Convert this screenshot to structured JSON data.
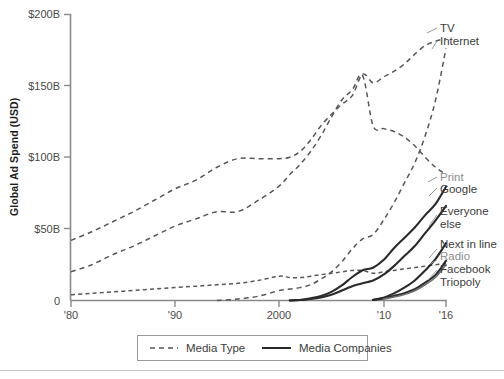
{
  "chart_data": {
    "type": "line",
    "title": "",
    "subtitle": "",
    "xlabel": "",
    "ylabel": "Global Ad Spend (USD)",
    "xlim": [
      1980,
      2016
    ],
    "ylim": [
      0,
      200
    ],
    "grid": false,
    "y_unit": "billions USD",
    "y_ticks": [
      0,
      50,
      100,
      150,
      200
    ],
    "y_tick_labels": [
      "0",
      "$50B",
      "$100B",
      "$150B",
      "$200B"
    ],
    "x_ticks": [
      1980,
      1990,
      2000,
      2010,
      2016
    ],
    "x_tick_labels": [
      "'80",
      "'90",
      "2000",
      "'10",
      "'16"
    ],
    "legend": {
      "position": "bottom-center",
      "entries": [
        {
          "label": "Media Type",
          "style": "dashed"
        },
        {
          "label": "Media Companies",
          "style": "solid"
        }
      ]
    },
    "series": [
      {
        "name": "TV",
        "style": "dashed",
        "group": "Media Type",
        "label_text": "TV",
        "x": [
          1980,
          1982,
          1984,
          1986,
          1988,
          1990,
          1992,
          1994,
          1996,
          1998,
          2000,
          2001,
          2002,
          2003,
          2004,
          2005,
          2006,
          2007,
          2008,
          2009,
          2010,
          2011,
          2012,
          2013,
          2014,
          2015,
          2016
        ],
        "values": [
          42,
          48,
          55,
          62,
          70,
          78,
          84,
          93,
          99,
          99,
          99,
          100,
          104,
          112,
          122,
          130,
          137,
          143,
          158,
          152,
          156,
          160,
          165,
          172,
          178,
          181,
          183
        ]
      },
      {
        "name": "Internet",
        "style": "dashed",
        "group": "Media Type",
        "label_text": "Internet",
        "x": [
          1994,
          1996,
          1998,
          2000,
          2001,
          2002,
          2003,
          2004,
          2005,
          2006,
          2007,
          2008,
          2009,
          2010,
          2011,
          2012,
          2013,
          2014,
          2015,
          2016
        ],
        "values": [
          0,
          1,
          3,
          7,
          8,
          9,
          11,
          15,
          20,
          27,
          36,
          43,
          46,
          56,
          68,
          82,
          96,
          115,
          140,
          176
        ]
      },
      {
        "name": "Print",
        "style": "dashed",
        "group": "Media Type",
        "label_text": "Print",
        "x": [
          1980,
          1982,
          1984,
          1986,
          1988,
          1990,
          1992,
          1994,
          1996,
          1998,
          2000,
          2001,
          2002,
          2003,
          2004,
          2005,
          2006,
          2007,
          2008,
          2009,
          2010,
          2011,
          2012,
          2013,
          2014,
          2015,
          2016
        ],
        "values": [
          20,
          25,
          32,
          38,
          45,
          52,
          57,
          62,
          62,
          70,
          80,
          88,
          95,
          104,
          115,
          128,
          140,
          147,
          157,
          122,
          120,
          118,
          114,
          108,
          100,
          93,
          88
        ]
      },
      {
        "name": "Radio",
        "style": "dashed",
        "group": "Media Type",
        "label_text": "Radio",
        "x": [
          1980,
          1982,
          1984,
          1986,
          1988,
          1990,
          1992,
          1994,
          1996,
          1998,
          2000,
          2001,
          2002,
          2003,
          2004,
          2005,
          2006,
          2007,
          2008,
          2009,
          2010,
          2011,
          2012,
          2013,
          2014,
          2015,
          2016
        ],
        "values": [
          4,
          5,
          6,
          7,
          8,
          9,
          10,
          11,
          12,
          14,
          17,
          16,
          16,
          17,
          18,
          19,
          20,
          21,
          21,
          19,
          20,
          21,
          22,
          23,
          24,
          25,
          26
        ]
      },
      {
        "name": "Google",
        "style": "solid",
        "group": "Media Companies",
        "label_text": "Google",
        "x": [
          2001,
          2002,
          2003,
          2004,
          2005,
          2006,
          2007,
          2008,
          2009,
          2010,
          2011,
          2012,
          2013,
          2014,
          2015,
          2016
        ],
        "values": [
          0,
          0.4,
          1.5,
          3.1,
          6.0,
          10.5,
          16.4,
          21.1,
          22.9,
          28.2,
          36.5,
          43.7,
          51.0,
          59.6,
          67.4,
          79.4
        ]
      },
      {
        "name": "Everyone else",
        "style": "solid",
        "group": "Media Companies",
        "label_text": "Everyone else",
        "x": [
          2001,
          2003,
          2005,
          2007,
          2009,
          2010,
          2011,
          2012,
          2013,
          2014,
          2015,
          2016
        ],
        "values": [
          0,
          1,
          4,
          10,
          14,
          18,
          24,
          31,
          38,
          47,
          56,
          66
        ]
      },
      {
        "name": "Next in line",
        "style": "solid",
        "group": "Media Companies",
        "label_text": "Next in line",
        "x": [
          2009,
          2010,
          2011,
          2012,
          2013,
          2014,
          2015,
          2016
        ],
        "values": [
          0.5,
          2,
          5,
          9,
          14,
          21,
          29,
          40
        ]
      },
      {
        "name": "Facebook",
        "style": "solid",
        "group": "Media Companies",
        "label_text": "Facebook",
        "x": [
          2009,
          2010,
          2011,
          2012,
          2013,
          2014,
          2015,
          2016
        ],
        "values": [
          0.4,
          1.5,
          3.2,
          5.1,
          7.9,
          12.5,
          17.9,
          27.6
        ]
      },
      {
        "name": "Triopoly",
        "style": "solid-thin",
        "group": "Media Companies",
        "label_text": "Triopoly",
        "x": [
          2010,
          2011,
          2012,
          2013,
          2014,
          2015,
          2016
        ],
        "values": [
          1.0,
          2.4,
          4.2,
          6.8,
          11.0,
          16.2,
          25.0
        ]
      }
    ],
    "annotations": [
      {
        "text": "TV",
        "anchor_series": "TV"
      },
      {
        "text": "Internet",
        "anchor_series": "Internet"
      },
      {
        "text": "Print",
        "anchor_series": "Print"
      },
      {
        "text": "Google",
        "anchor_series": "Google"
      },
      {
        "text": "Everyone",
        "anchor_series": "Everyone else"
      },
      {
        "text": "else",
        "anchor_series": "Everyone else"
      },
      {
        "text": "Next in line",
        "anchor_series": "Next in line"
      },
      {
        "text": "Radio",
        "anchor_series": "Radio"
      },
      {
        "text": "Facebook",
        "anchor_series": "Facebook"
      },
      {
        "text": "Triopoly",
        "anchor_series": "Triopoly"
      }
    ]
  },
  "labels": {
    "tv": "TV",
    "internet": "Internet",
    "print": "Print",
    "google": "Google",
    "everyone_1": "Everyone",
    "everyone_2": "else",
    "next_in_line": "Next in line",
    "radio": "Radio",
    "facebook": "Facebook",
    "triopoly": "Triopoly"
  },
  "axis": {
    "y_title": "Global Ad Spend (USD)",
    "y0": "0",
    "y50": "$50B",
    "y100": "$100B",
    "y150": "$150B",
    "y200": "$200B",
    "x80": "'80",
    "x90": "'90",
    "x2000": "2000",
    "x10": "'10",
    "x16": "'16"
  },
  "legend": {
    "media_type": "Media Type",
    "media_companies": "Media Companies"
  },
  "colors": {
    "dashed_stroke": "#54585c",
    "solid_stroke": "#2a2a2a",
    "thin_stroke": "#6e6e6e",
    "axis": "#8a8a8a",
    "label_text": "#3c3c3c",
    "label_muted": "#8e8e8e",
    "background": "#ffffff"
  }
}
